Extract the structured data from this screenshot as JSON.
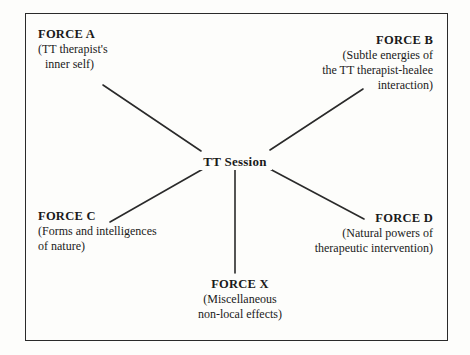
{
  "diagram": {
    "type": "radial-hub-and-spoke",
    "frame": {
      "present": true,
      "color": "#2a2a2a"
    },
    "background_color": "#fdfdfb",
    "line_color": "#2a2a2a",
    "hub": {
      "id": "tt-session",
      "label": "TT Session"
    },
    "nodes": [
      {
        "id": "force-a",
        "title": "FORCE A",
        "lines": [
          "(TT therapist's",
          "inner self)"
        ],
        "align": "left",
        "position": "top-left"
      },
      {
        "id": "force-b",
        "title": "FORCE B",
        "lines": [
          "(Subtle energies of",
          "the TT therapist-healee",
          "interaction)"
        ],
        "align": "right",
        "position": "top-right"
      },
      {
        "id": "force-c",
        "title": "FORCE C",
        "lines": [
          "(Forms and intelligences",
          "of nature)"
        ],
        "align": "left",
        "position": "bottom-left"
      },
      {
        "id": "force-d",
        "title": "FORCE D",
        "lines": [
          "(Natural powers of",
          "therapeutic intervention)"
        ],
        "align": "right",
        "position": "bottom-right"
      },
      {
        "id": "force-x",
        "title": "FORCE X",
        "lines": [
          "(Miscellaneous",
          "non-local effects)"
        ],
        "align": "center",
        "position": "bottom-center"
      }
    ],
    "edges": [
      {
        "from": "force-a",
        "to": "tt-session"
      },
      {
        "from": "force-b",
        "to": "tt-session"
      },
      {
        "from": "force-c",
        "to": "tt-session"
      },
      {
        "from": "force-d",
        "to": "tt-session"
      },
      {
        "from": "force-x",
        "to": "tt-session"
      }
    ]
  }
}
